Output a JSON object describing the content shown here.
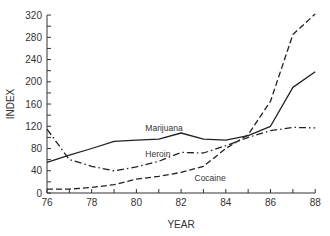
{
  "chart_data": {
    "type": "line",
    "title": "",
    "xlabel": "YEAR",
    "ylabel": "INDEX",
    "xlim": [
      76,
      88
    ],
    "ylim": [
      0,
      320
    ],
    "x_ticks": [
      76,
      78,
      80,
      82,
      84,
      86,
      88
    ],
    "y_ticks": [
      0,
      40,
      80,
      120,
      160,
      200,
      240,
      280,
      320
    ],
    "grid": false,
    "legend": "inline labels",
    "x": [
      76,
      77,
      78,
      79,
      80,
      81,
      82,
      83,
      84,
      85,
      86,
      87,
      88
    ],
    "series": [
      {
        "name": "Marijuana",
        "style": "solid",
        "values": [
          55,
          68,
          80,
          93,
          95,
          97,
          108,
          97,
          95,
          103,
          120,
          190,
          218
        ],
        "label_pos": {
          "year": 80.4,
          "value": 112
        }
      },
      {
        "name": "Heroin",
        "style": "dash-dot",
        "values": [
          115,
          60,
          48,
          40,
          47,
          57,
          73,
          72,
          85,
          100,
          112,
          118,
          117
        ],
        "label_pos": {
          "year": 80.4,
          "value": 64
        }
      },
      {
        "name": "Cocaine",
        "style": "dashed",
        "values": [
          7,
          7,
          10,
          15,
          25,
          30,
          37,
          48,
          80,
          105,
          165,
          285,
          322
        ],
        "label_pos": {
          "year": 82.6,
          "value": 22
        }
      }
    ]
  },
  "plot": {
    "x0": 47,
    "x_per_unit": 22.35,
    "y0": 193,
    "y_per_unit": 0.556,
    "line_color": "#222222",
    "axis_color": "#333333"
  }
}
